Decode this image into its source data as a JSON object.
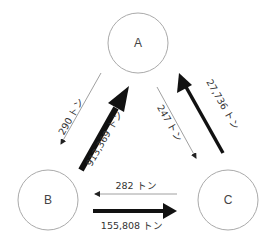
{
  "diagram": {
    "type": "flow-triangle",
    "nodes": [
      {
        "id": "A",
        "label": "A"
      },
      {
        "id": "B",
        "label": "B"
      },
      {
        "id": "C",
        "label": "C"
      }
    ],
    "edges": [
      {
        "from": "A",
        "to": "B",
        "label": "290 トン",
        "weight": "thin"
      },
      {
        "from": "B",
        "to": "A",
        "label": "913,369 トン",
        "weight": "thick"
      },
      {
        "from": "A",
        "to": "C",
        "label": "247 トン",
        "weight": "thin"
      },
      {
        "from": "C",
        "to": "A",
        "label": "27,736 トン",
        "weight": "medium"
      },
      {
        "from": "C",
        "to": "B",
        "label": "282 トン",
        "weight": "thin"
      },
      {
        "from": "B",
        "to": "C",
        "label": "155,808 トン",
        "weight": "thick"
      }
    ],
    "colors": {
      "circle_stroke": "#aaaaaa",
      "arrow": "#111111",
      "thin_arrow": "#777777"
    }
  }
}
